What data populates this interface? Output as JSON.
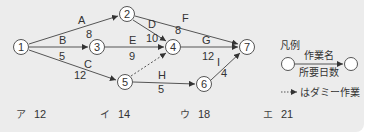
{
  "diagram": {
    "nodes": [
      {
        "id": "1",
        "label": "1",
        "x": 21,
        "y": 47
      },
      {
        "id": "2",
        "label": "2",
        "x": 127,
        "y": 14
      },
      {
        "id": "3",
        "label": "3",
        "x": 97,
        "y": 47
      },
      {
        "id": "4",
        "label": "4",
        "x": 173,
        "y": 47
      },
      {
        "id": "5",
        "label": "5",
        "x": 125,
        "y": 82
      },
      {
        "id": "6",
        "label": "6",
        "x": 204,
        "y": 84
      },
      {
        "id": "7",
        "label": "7",
        "x": 247,
        "y": 47
      }
    ],
    "edges": [
      {
        "from": "1",
        "to": "2",
        "name": "A",
        "days": "8",
        "dummy": false
      },
      {
        "from": "1",
        "to": "3",
        "name": "B",
        "days": "5",
        "dummy": false
      },
      {
        "from": "1",
        "to": "5",
        "name": "C",
        "days": "12",
        "dummy": false
      },
      {
        "from": "2",
        "to": "4",
        "name": "D",
        "days": "10",
        "dummy": false
      },
      {
        "from": "3",
        "to": "4",
        "name": "E",
        "days": "9",
        "dummy": false
      },
      {
        "from": "2",
        "to": "7",
        "name": "F",
        "days": "8",
        "dummy": false
      },
      {
        "from": "4",
        "to": "7",
        "name": "G",
        "days": "12",
        "dummy": false
      },
      {
        "from": "5",
        "to": "6",
        "name": "H",
        "days": "5",
        "dummy": false
      },
      {
        "from": "6",
        "to": "7",
        "name": "I",
        "days": "4",
        "dummy": false
      },
      {
        "from": "5",
        "to": "4",
        "name": "",
        "days": "",
        "dummy": true
      }
    ]
  },
  "legend": {
    "title": "凡例",
    "task_name": "作業名",
    "duration": "所要日数",
    "dummy_note": "はダミー作業"
  },
  "answers": [
    {
      "key": "ア",
      "value": "12"
    },
    {
      "key": "イ",
      "value": "14"
    },
    {
      "key": "ウ",
      "value": "18"
    },
    {
      "key": "エ",
      "value": "21"
    }
  ],
  "colors": {
    "background": "#ececec",
    "line": "#555555",
    "node_fill": "#ffffff"
  }
}
